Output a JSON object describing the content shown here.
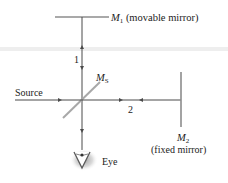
{
  "diagram": {
    "labels": {
      "m1_symbol": "M",
      "m1_sub": "1",
      "m1_desc": " (movable mirror)",
      "ms_symbol": "M",
      "ms_sub": "S",
      "m2_symbol": "M",
      "m2_sub": "2",
      "m2_desc": "(fixed mirror)",
      "path1": "1",
      "path2": "2",
      "source": "Source",
      "eye": "Eye"
    },
    "colors": {
      "mirror": "#8c8c8c",
      "beam": "#4a4a4a",
      "splitter": "#a8a8a8",
      "text": "#222222",
      "eye_glow": "#9a9a9a"
    }
  }
}
